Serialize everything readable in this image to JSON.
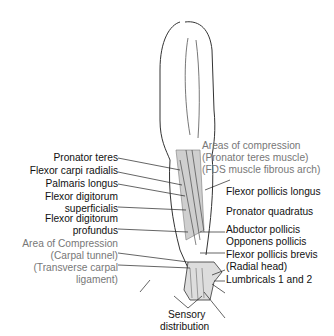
{
  "left_labels": [
    {
      "text": "Pronator teres",
      "gray": false
    },
    {
      "text": "Flexor carpi radialis",
      "gray": false
    },
    {
      "text": "Palmaris longus",
      "gray": false
    },
    {
      "text": "Flexor digitorum",
      "gray": false
    },
    {
      "text": "superficialis",
      "gray": false
    },
    {
      "text": "Flexor digitorum",
      "gray": false
    },
    {
      "text": "profundus",
      "gray": false
    },
    {
      "text": "Area of Compression",
      "gray": true
    },
    {
      "text": "(Carpal tunnel)",
      "gray": true
    },
    {
      "text": "(Transverse carpal",
      "gray": true
    },
    {
      "text": "ligament)",
      "gray": true
    }
  ],
  "right_labels": [
    {
      "text": "Areas of compression",
      "gray": true
    },
    {
      "text": "(Pronator teres muscle)",
      "gray": true
    },
    {
      "text": "(FDS muscle fibrous arch)",
      "gray": true
    },
    {
      "text": "Flexor pollicis longus",
      "gray": false
    },
    {
      "text": "Pronator quadratus",
      "gray": false
    },
    {
      "text": "Abductor pollicis",
      "gray": false
    },
    {
      "text": "Opponens pollicis",
      "gray": false
    },
    {
      "text": "Flexor pollicis brevis",
      "gray": false
    },
    {
      "text": "(Radial head)",
      "gray": false
    },
    {
      "text": "Lumbricals 1 and 2",
      "gray": false
    }
  ],
  "bottom_label": [
    "Sensory",
    "distribution"
  ],
  "colors": {
    "label": "#111111",
    "compression_label": "#777777",
    "line": "#222222"
  }
}
